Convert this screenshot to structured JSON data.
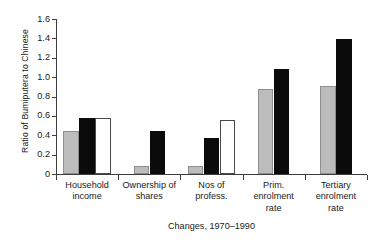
{
  "chart_data": {
    "type": "bar",
    "title": "",
    "xlabel": "Changes, 1970–1990",
    "ylabel": "Ratio of Bumiputera to Chinese",
    "categories": [
      "Household income",
      "Ownership of shares",
      "Nos of profess.",
      "Prim. enrolment rate",
      "Tertiary enrolment rate"
    ],
    "category_lines": [
      [
        "Household",
        "income"
      ],
      [
        "Ownership of",
        "shares"
      ],
      [
        "Nos of",
        "profess."
      ],
      [
        "Prim.",
        "enrolment",
        "rate"
      ],
      [
        "Tertiary",
        "enrolment",
        "rate"
      ]
    ],
    "series": [
      {
        "name": "gray",
        "color": "#bcbcbc",
        "values": [
          0.44,
          0.08,
          0.08,
          0.88,
          0.91
        ]
      },
      {
        "name": "black",
        "color": "#0b0b0b",
        "values": [
          0.58,
          0.44,
          0.37,
          1.08,
          1.39
        ]
      },
      {
        "name": "white",
        "color": "#ffffff",
        "values": [
          0.58,
          null,
          0.56,
          null,
          null
        ]
      }
    ],
    "ylim": [
      0,
      1.6
    ],
    "ytick_values": [
      0,
      0.2,
      0.4,
      0.6,
      0.8,
      1.0,
      1.2,
      1.4,
      1.6
    ],
    "ytick_labels": [
      "0",
      "0.2",
      "0.4",
      "0.6",
      "0.8",
      "1.0",
      "1.2",
      "1.4",
      "1.6"
    ],
    "grid": false,
    "legend": "none"
  },
  "colors": {
    "axis": "#3d3d3d",
    "text": "#1a1a1a",
    "background": "#ffffff",
    "series_gray": "#bcbcbc",
    "series_gray_edge": "#8e8e8e",
    "series_black": "#0b0b0b",
    "series_white": "#ffffff",
    "series_white_edge": "#4a4a4a"
  }
}
